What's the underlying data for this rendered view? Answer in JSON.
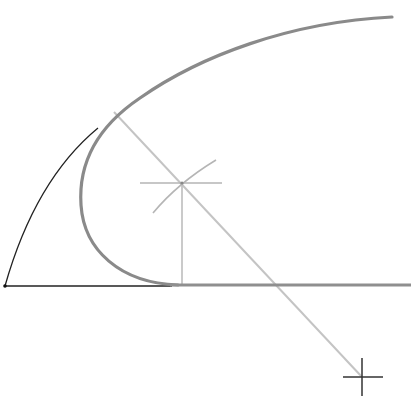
{
  "diagram": {
    "type": "geometric-construction",
    "colors": {
      "background": "#ffffff",
      "construction_black": "#222222",
      "main_curve_gray": "#8a8a8a",
      "construction_light": "#bdbdbd"
    },
    "elements": {
      "base_line": {
        "x1": 5,
        "y1": 286,
        "x2": 170,
        "y2": 286
      },
      "black_arc": {
        "start": [
          5,
          286
        ],
        "end": [
          97,
          130
        ]
      },
      "outer_curve": {
        "path": "M 175 285 C 120 282 86 250 82 205 C 78 160 100 125 140 98 C 200 55 290 22 392 17"
      },
      "horizontal_gray_line": {
        "x1": 170,
        "y1": 285,
        "x2": 411,
        "y2": 285
      },
      "diagonal_line": {
        "x1": 114,
        "y1": 112,
        "x2": 362,
        "y2": 377
      },
      "center_mark": {
        "x": 182,
        "y": 183
      },
      "center_horizontal_arm": {
        "x1": 140,
        "x2": 222,
        "y": 183
      },
      "center_arc_mark": {
        "x1": 155,
        "y1": 212,
        "x2": 215,
        "y2": 160
      },
      "center_vertical": {
        "x": 182,
        "y1": 183,
        "y2": 285
      },
      "far_cross": {
        "x": 362,
        "y": 377,
        "h_half": 20,
        "v_half": 19
      }
    }
  }
}
